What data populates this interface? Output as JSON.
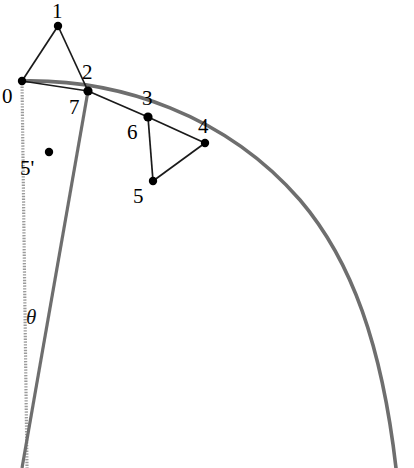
{
  "figure": {
    "canvas": {
      "width": 414,
      "height": 468,
      "background": "#ffffff"
    },
    "colors": {
      "arc": "#6e6e6e",
      "radius_dotted": "#9a9a9a",
      "radius_solid": "#6e6e6e",
      "chord": "#1a1a1a",
      "vertex": "#000000",
      "label": "#000000"
    },
    "labels": {
      "p0": "0",
      "p1": "1",
      "p2": "2",
      "p3": "3",
      "p4": "4",
      "p5": "5",
      "p5prime": "5'",
      "p6": "6",
      "p7": "7",
      "theta": "θ"
    },
    "vertices": [
      {
        "id": "0",
        "label": "0",
        "x": 22,
        "y": 81,
        "label_x": 2,
        "label_y": 86,
        "dot": true
      },
      {
        "id": "1",
        "label": "1",
        "x": 58,
        "y": 26,
        "label_x": 52,
        "label_y": 1,
        "dot": true
      },
      {
        "id": "2",
        "label": "2",
        "x": 88,
        "y": 91,
        "label_x": 82,
        "label_y": 62,
        "dot": true
      },
      {
        "id": "7",
        "label": "7",
        "x": 88,
        "y": 91,
        "label_x": 69,
        "label_y": 97,
        "dot": false
      },
      {
        "id": "3",
        "label": "3",
        "x": 148,
        "y": 117,
        "label_x": 142,
        "label_y": 88,
        "dot": true
      },
      {
        "id": "6",
        "label": "6",
        "x": 148,
        "y": 117,
        "label_x": 127,
        "label_y": 122,
        "dot": false
      },
      {
        "id": "4",
        "label": "4",
        "x": 205,
        "y": 143,
        "label_x": 198,
        "label_y": 116,
        "dot": true
      },
      {
        "id": "5",
        "label": "5",
        "x": 153,
        "y": 181,
        "label_x": 133,
        "label_y": 186,
        "dot": true
      },
      {
        "id": "5'",
        "label": "5'",
        "x": 49,
        "y": 152,
        "label_x": 20,
        "label_y": 158,
        "dot": true
      }
    ],
    "angle_marker": {
      "label": "θ",
      "x": 26,
      "y": 307
    },
    "arc": {
      "description": "large circular arc from vertex 0 curving right and down to bottom-right",
      "center_x": 24,
      "center_y": 438,
      "radius": 358,
      "start_angle_deg": 93.5,
      "end_angle_deg": 0
    },
    "radii": [
      {
        "name": "radius-dotted-left",
        "from": {
          "x": 22,
          "y": 81
        },
        "to": {
          "x": 27,
          "y": 468
        },
        "style": "dotted"
      },
      {
        "name": "radius-solid-right",
        "from": {
          "x": 88,
          "y": 91
        },
        "to": {
          "x": 22,
          "y": 468
        },
        "style": "solid"
      }
    ],
    "chords": [
      {
        "name": "chord-0-1",
        "from": "0",
        "to": "1"
      },
      {
        "name": "chord-1-2",
        "from": "1",
        "to": "2"
      },
      {
        "name": "chord-0-2",
        "from": "0",
        "to": "2"
      },
      {
        "name": "chord-2-3",
        "from": "2",
        "to": "3"
      },
      {
        "name": "chord-3-4",
        "from": "3",
        "to": "4"
      },
      {
        "name": "chord-4-5",
        "from": "4",
        "to": "5"
      },
      {
        "name": "chord-5-3",
        "from": "5",
        "to": "3"
      }
    ]
  }
}
